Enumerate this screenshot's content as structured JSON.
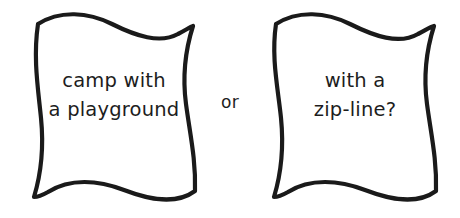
{
  "canvas": {
    "width": 460,
    "height": 218,
    "background_color": "#ffffff"
  },
  "style": {
    "outline_color": "#1a1a1a",
    "fill_color": "#ffffff",
    "text_color": "#1d1d1d"
  },
  "options": [
    {
      "id": "left",
      "shape": "wavy-quadrilateral",
      "lines": [
        "camp with",
        "a playground"
      ]
    },
    {
      "id": "right",
      "shape": "wavy-quadrilateral",
      "lines": [
        "with a",
        "zip-line?"
      ]
    }
  ],
  "connector": {
    "label": "or"
  }
}
